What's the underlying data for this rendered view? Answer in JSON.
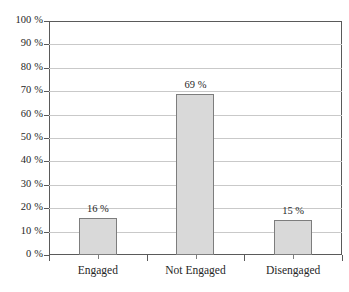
{
  "chart_data": {
    "type": "bar",
    "title": "",
    "subtitle": "",
    "xlabel": "",
    "ylabel": "",
    "categories": [
      "Engaged",
      "Not Engaged",
      "Disengaged"
    ],
    "values": [
      16,
      69,
      15
    ],
    "value_labels": [
      "16 %",
      "69 %",
      "15 %"
    ],
    "ylim": [
      0,
      100
    ],
    "ytick_values": [
      0,
      10,
      20,
      30,
      40,
      50,
      60,
      70,
      80,
      90,
      100
    ],
    "ytick_labels": [
      "0 %",
      "10 %",
      "20 %",
      "30 %",
      "40 %",
      "50 %",
      "60 %",
      "70 %",
      "80 %",
      "90 %",
      "100 %"
    ],
    "grid": true,
    "grid_axis": "y",
    "legend": false,
    "legend_position": "none",
    "series": [
      {
        "name": "",
        "values": [
          16,
          69,
          15
        ]
      }
    ],
    "colors": {
      "bar_fill": "#d9d9d9",
      "bar_border": "#7d7d7d",
      "gridline": "#c9c9c9",
      "axis": "#5a5a5a",
      "background": "#ffffff",
      "text": "#262626"
    }
  }
}
